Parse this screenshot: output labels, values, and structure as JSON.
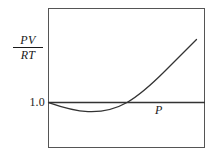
{
  "figure": {
    "name": "compressibility-factor-plot",
    "background_color": "#ffffff",
    "frame": {
      "x": 48,
      "y": 8,
      "width": 157,
      "height": 140,
      "stroke_color": "#555555",
      "stroke_width": 1
    }
  },
  "labels": {
    "y_axis_numerator": "PV",
    "y_axis_denominator": "RT",
    "y_tick_value": "1.0",
    "x_axis_label": "P"
  },
  "chart_data": {
    "type": "line",
    "title": "",
    "xlabel": "P",
    "ylabel": "PV/RT",
    "grid": false,
    "legend": null,
    "xlim": [
      0,
      1
    ],
    "ylim": [
      0.78,
      1.62
    ],
    "annotations": [
      {
        "text": "1.0",
        "role": "y-tick",
        "y_value": 1.0
      },
      {
        "text": "P",
        "role": "x-axis-label"
      },
      {
        "text": "PV/RT",
        "role": "y-axis-label"
      }
    ],
    "series": [
      {
        "name": "ideal-gas-reference",
        "style": "straight-horizontal",
        "color": "#333333",
        "x": [
          0.0,
          1.0
        ],
        "values": [
          1.0,
          1.0
        ]
      },
      {
        "name": "real-gas-curve",
        "style": "curve",
        "color": "#333333",
        "x": [
          0.0,
          0.06,
          0.13,
          0.19,
          0.25,
          0.32,
          0.38,
          0.44,
          0.5,
          0.57,
          0.63,
          0.7,
          0.76,
          0.82,
          0.89,
          0.94
        ],
        "values": [
          1.0,
          0.97,
          0.95,
          0.94,
          0.94,
          0.95,
          0.97,
          1.0,
          1.05,
          1.11,
          1.18,
          1.26,
          1.35,
          1.45,
          1.56,
          1.62
        ]
      }
    ]
  },
  "geometry": {
    "ideal_line_path": "M 48 102.5 L 205 102.5",
    "real_curve_path": "M 48.5 102.5 C 60 106.5, 72 110.8, 88 111.6 C 104 112.3, 118 107.6, 127 102.5 C 139 95.5, 152 84, 165 71 C 178 58, 189 47, 196.5 39.5"
  }
}
